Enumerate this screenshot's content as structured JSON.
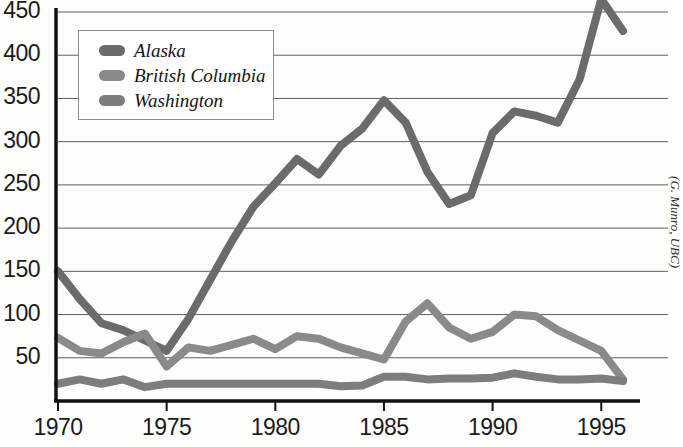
{
  "attribution": "(G. Munro, UBC)",
  "legend": {
    "items": [
      {
        "label": "Alaska",
        "color": "#6b6b6b"
      },
      {
        "label": "British Columbia",
        "color": "#8a8a8a"
      },
      {
        "label": "Washington",
        "color": "#7d7d7d"
      }
    ]
  },
  "axes": {
    "y_ticks": [
      50,
      100,
      150,
      200,
      250,
      300,
      350,
      400,
      450
    ],
    "x_ticks": [
      1970,
      1975,
      1980,
      1985,
      1990,
      1995
    ],
    "ylim": [
      0,
      450
    ],
    "xlim": [
      1970,
      1996
    ]
  },
  "chart_data": {
    "type": "line",
    "title": "",
    "subtitle": "",
    "xlabel": "",
    "ylabel": "",
    "xlim": [
      1970,
      1996
    ],
    "ylim": [
      0,
      450
    ],
    "grid": true,
    "legend_position": "top-left",
    "annotations": [
      "(G. Munro, UBC)"
    ],
    "x": [
      1970,
      1971,
      1972,
      1973,
      1974,
      1975,
      1976,
      1977,
      1978,
      1979,
      1980,
      1981,
      1982,
      1983,
      1984,
      1985,
      1986,
      1987,
      1988,
      1989,
      1990,
      1991,
      1992,
      1993,
      1994,
      1995,
      1996
    ],
    "series": [
      {
        "name": "Alaska",
        "color": "#6b6b6b",
        "values": [
          150,
          118,
          90,
          82,
          70,
          58,
          95,
          140,
          185,
          225,
          252,
          280,
          262,
          295,
          315,
          348,
          322,
          265,
          228,
          238,
          310,
          335,
          330,
          322,
          372,
          465,
          428
        ]
      },
      {
        "name": "British Columbia",
        "color": "#8a8a8a",
        "values": [
          73,
          58,
          55,
          68,
          78,
          40,
          62,
          58,
          65,
          72,
          60,
          75,
          72,
          62,
          55,
          48,
          92,
          113,
          85,
          72,
          80,
          100,
          98,
          82,
          70,
          58,
          25
        ]
      },
      {
        "name": "Washington",
        "color": "#7d7d7d",
        "values": [
          20,
          25,
          20,
          25,
          16,
          20,
          20,
          20,
          20,
          20,
          20,
          20,
          20,
          17,
          18,
          28,
          28,
          25,
          26,
          26,
          27,
          32,
          28,
          25,
          25,
          26,
          23
        ]
      }
    ]
  }
}
